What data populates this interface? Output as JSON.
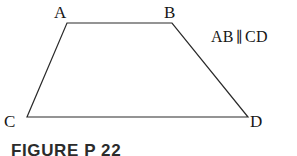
{
  "figure": {
    "background_color": "#ffffff",
    "stroke_color": "#2a2a2a",
    "stroke_width": 1.2,
    "vertices": {
      "a": {
        "label": "A",
        "x": 67,
        "y": 23
      },
      "b": {
        "label": "B",
        "x": 172,
        "y": 23
      },
      "c": {
        "label": "C",
        "x": 27,
        "y": 117
      },
      "d": {
        "label": "D",
        "x": 248,
        "y": 117
      }
    },
    "annotation": {
      "segment_1": "AB",
      "parallel_symbol": "∥",
      "segment_2": "CD"
    },
    "caption": "FIGURE P 22"
  }
}
